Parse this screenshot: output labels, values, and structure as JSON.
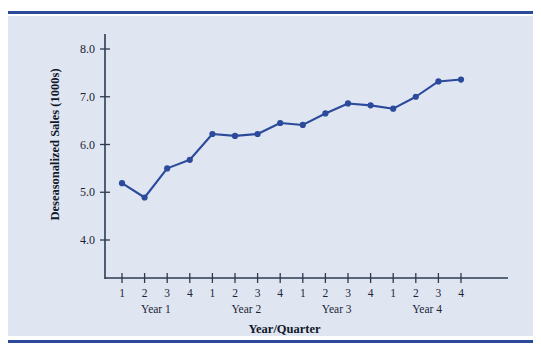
{
  "figure": {
    "background_color": "#dfe6f2",
    "rule_color": "#2b4a9b",
    "series_color": "#2b4a9b",
    "axis_color": "#2d3a52"
  },
  "chart_data": {
    "type": "line",
    "title": "",
    "xlabel": "Year/Quarter",
    "ylabel": "Deseasonalized Sales (1000s)",
    "ylim": [
      3.4,
      8.4
    ],
    "yticks": [
      "4.0",
      "5.0",
      "6.0",
      "7.0",
      "8.0"
    ],
    "ytick_values": [
      4.0,
      5.0,
      6.0,
      7.0,
      8.0
    ],
    "grid": false,
    "legend": "none",
    "categories": [
      "1",
      "2",
      "3",
      "4",
      "1",
      "2",
      "3",
      "4",
      "1",
      "2",
      "3",
      "4",
      "1",
      "2",
      "3",
      "4"
    ],
    "group_labels": [
      "Year 1",
      "Year 2",
      "Year 3",
      "Year 4"
    ],
    "values": [
      5.19,
      4.89,
      5.5,
      5.68,
      6.22,
      6.18,
      6.22,
      6.45,
      6.41,
      6.65,
      6.86,
      6.82,
      6.75,
      7.0,
      7.32,
      7.36
    ],
    "series": [
      {
        "name": "Deseasonalized Sales",
        "values": [
          5.19,
          4.89,
          5.5,
          5.68,
          6.22,
          6.18,
          6.22,
          6.45,
          6.41,
          6.65,
          6.86,
          6.82,
          6.75,
          7.0,
          7.32,
          7.36
        ]
      }
    ]
  }
}
